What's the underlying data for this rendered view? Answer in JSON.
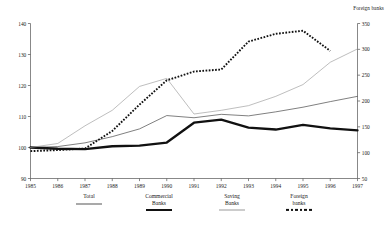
{
  "chart_data": {
    "type": "line",
    "title": "",
    "subtitle": "",
    "xlabel": "",
    "ylabel": "",
    "grid": false,
    "legend_position": "bottom",
    "x": [
      1985,
      1986,
      1987,
      1988,
      1989,
      1990,
      1991,
      1992,
      1993,
      1994,
      1995,
      1996,
      1997
    ],
    "xticklabels": [
      "1985",
      "1986",
      "1987",
      "1988",
      "1989",
      "1990",
      "1991",
      "1992",
      "1993",
      "1994",
      "1995",
      "1996",
      "1997"
    ],
    "left_axis": {
      "ylim": [
        90,
        140
      ],
      "yticks": [
        90,
        100,
        110,
        120,
        130,
        140
      ],
      "yticklabels": [
        "90",
        "100",
        "110",
        "120",
        "130",
        "140"
      ]
    },
    "right_axis": {
      "label": "Foreign banks",
      "ylim": [
        50,
        350
      ],
      "yticks": [
        50,
        100,
        150,
        200,
        250,
        300,
        350
      ],
      "yticklabels": [
        "50",
        "100",
        "150",
        "200",
        "250",
        "300",
        "350"
      ]
    },
    "series": [
      {
        "name": "Total",
        "axis": "left",
        "style": "thin-solid",
        "color": "#555555",
        "values": [
          100.0,
          100.3,
          101.5,
          103.5,
          106.0,
          110.3,
          109.6,
          110.7,
          110.2,
          111.5,
          113.0,
          114.8,
          116.5
        ]
      },
      {
        "name": "Commercial Banks",
        "axis": "left",
        "style": "thick-solid",
        "color": "#111111",
        "values": [
          100.0,
          99.6,
          99.5,
          100.4,
          100.6,
          101.6,
          108.0,
          109.0,
          106.4,
          105.8,
          107.3,
          106.2,
          105.5
        ]
      },
      {
        "name": "Saving Banks",
        "axis": "left",
        "style": "thin-light",
        "color": "#9a9a9a",
        "values": [
          100.0,
          101.3,
          107.0,
          112.0,
          119.7,
          122.3,
          110.8,
          112.0,
          113.5,
          116.5,
          120.3,
          127.5,
          131.8
        ]
      },
      {
        "name": "Foreign banks",
        "axis": "right",
        "style": "dotted",
        "color": "#111111",
        "values": [
          103,
          105,
          108,
          142,
          193,
          240,
          257,
          261,
          315,
          330,
          336,
          297,
          null
        ]
      }
    ]
  },
  "right_axis_title": "Foreign banks",
  "legend": {
    "items": [
      {
        "label": "Total",
        "swatch": "thin-solid-swatch"
      },
      {
        "label": "Commercial\nBanks",
        "swatch": "thick-solid-swatch"
      },
      {
        "label": "Saving\nBanks",
        "swatch": "thin-light-swatch"
      },
      {
        "label": "Foreign\nbanks",
        "swatch": "dotted-swatch"
      }
    ]
  }
}
